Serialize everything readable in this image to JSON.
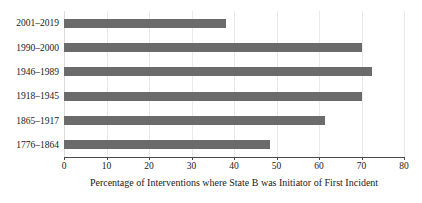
{
  "chart_data": {
    "type": "bar",
    "orientation": "horizontal",
    "title": "",
    "xlabel": "Percentage of Interventions where State B was Initiator of First Incident",
    "ylabel": "",
    "categories": [
      "2001–2019",
      "1990–2000",
      "1946–1989",
      "1918–1945",
      "1865–1917",
      "1776–1864"
    ],
    "values": [
      38,
      70,
      72.5,
      70,
      61.5,
      48.5
    ],
    "xlim": [
      0,
      80
    ],
    "xticks": [
      0,
      10,
      20,
      30,
      40,
      50,
      60,
      70,
      80
    ],
    "xtick_labels": [
      "0",
      "10",
      "20",
      "30",
      "40",
      "50",
      "60",
      "70",
      "80"
    ],
    "grid": true,
    "legend": false,
    "bar_color": "#6b6b6b",
    "gridline_color": "#e9e9e9",
    "axis_color": "#4a4a4a",
    "background_color": "#ffffff"
  }
}
